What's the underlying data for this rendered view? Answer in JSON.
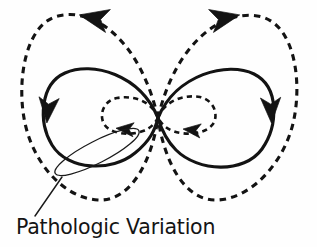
{
  "figure": {
    "title": "Pathologic Variation",
    "width": 317,
    "height": 247,
    "background_color": "#fefefe",
    "ink_color": "#131313",
    "caption": {
      "text": "Pathologic Variation",
      "x": 16,
      "y": 217,
      "font_size": 20.5
    },
    "callout": {
      "name": "pathologic-variation-callout",
      "shape": "thin-ellipse-lasso",
      "center_x": 97,
      "center_y": 152,
      "radius_x": 47,
      "radius_y": 11,
      "rotation_deg": -27,
      "leader_from_x": 62,
      "leader_from_y": 177,
      "leader_to_x": 35,
      "leader_to_y": 216
    },
    "geometry": {
      "crossing_point_x": 158,
      "crossing_point_y": 118,
      "solid_left_lobe": {
        "left": 48,
        "right": 158,
        "top": 68,
        "bottom": 166
      },
      "solid_right_lobe": {
        "left": 158,
        "right": 272,
        "top": 68,
        "bottom": 166
      },
      "dashed_outer_left_lobe": {
        "left": 22,
        "right": 158,
        "top": 11,
        "bottom": 201
      },
      "dashed_outer_right_lobe": {
        "left": 158,
        "right": 297,
        "top": 11,
        "bottom": 201
      },
      "dashed_inner_left_loop": {
        "left": 101,
        "right": 158,
        "top": 97,
        "bottom": 133
      },
      "dashed_inner_right_loop": {
        "left": 158,
        "right": 218,
        "top": 97,
        "bottom": 133
      }
    },
    "curves": [
      {
        "name": "solid-left-lobe",
        "style": "solid",
        "description": "solid left lobe of figure-eight",
        "path": "M 158 118 C 140 74, 92 61, 65 73 C 40 84, 38 122, 52 145 C 68 171, 112 172, 135 153 C 150 141, 155 130, 158 118 Z"
      },
      {
        "name": "solid-right-lobe",
        "style": "solid",
        "description": "solid right lobe of figure-eight",
        "path": "M 158 118 C 176 74, 228 61, 254 74 C 280 87, 278 126, 262 149 C 244 174, 198 172, 176 150 C 165 139, 161 128, 158 118 Z"
      },
      {
        "name": "dashed-outer-left-lobe",
        "style": "dashed",
        "description": "large dashed left lobe, counterclockwise",
        "path": "M 158 118 C 140 40, 94 7, 58 16 C 26 24, 17 78, 24 118 C 31 160, 62 198, 98 200 C 131 202, 152 160, 158 118 Z"
      },
      {
        "name": "dashed-outer-right-lobe",
        "style": "dashed",
        "description": "large dashed right lobe, clockwise",
        "path": "M 158 118 C 176 40, 226 7, 262 17 C 294 26, 302 79, 294 119 C 286 160, 253 198, 218 200 C 184 202, 164 160, 158 118 Z"
      },
      {
        "name": "dashed-inner-left-loop",
        "style": "dashed",
        "description": "small dashed inner left loop",
        "path": "M 158 118 C 152 101, 133 95, 117 98 C 103 101, 99 115, 104 124 C 110 134, 130 136, 143 131 C 151 128, 155 123, 158 118 Z"
      },
      {
        "name": "dashed-inner-right-loop",
        "style": "dashed",
        "description": "small dashed inner right loop",
        "path": "M 158 118 C 164 101, 184 94, 200 97 C 214 100, 219 115, 213 124 C 206 134, 186 136, 173 131 C 165 128, 161 123, 158 118 Z"
      }
    ],
    "arrows": [
      {
        "name": "arrow-outer-left-top",
        "on": "dashed-outer-left-lobe",
        "x": 94,
        "y": 18,
        "direction": "left",
        "angle_deg": 192,
        "size": 15
      },
      {
        "name": "arrow-outer-right-top",
        "on": "dashed-outer-right-lobe",
        "x": 225,
        "y": 18,
        "direction": "right",
        "angle_deg": -12,
        "size": 15
      },
      {
        "name": "arrow-solid-left-side",
        "on": "solid-left-lobe",
        "x": 48,
        "y": 110,
        "direction": "down",
        "angle_deg": 95,
        "size": 13
      },
      {
        "name": "arrow-solid-right-side",
        "on": "solid-right-lobe",
        "x": 271,
        "y": 110,
        "direction": "down",
        "angle_deg": 88,
        "size": 13
      },
      {
        "name": "arrow-inner-left-loop",
        "on": "dashed-inner-left-loop",
        "x": 125,
        "y": 129,
        "direction": "left",
        "angle_deg": 185,
        "size": 9
      },
      {
        "name": "arrow-inner-right-loop",
        "on": "dashed-inner-right-loop",
        "x": 192,
        "y": 130,
        "direction": "left",
        "angle_deg": 186,
        "size": 9
      }
    ]
  }
}
